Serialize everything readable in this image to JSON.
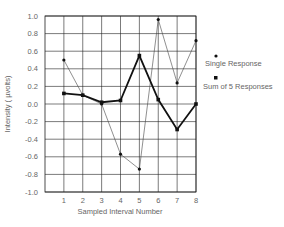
{
  "chart_data": {
    "type": "line",
    "title": "",
    "xlabel": "Sampled Interval Number",
    "ylabel": "Intensity ( µvolts)",
    "x": [
      1,
      2,
      3,
      4,
      5,
      6,
      7,
      8
    ],
    "xlim": [
      0,
      8
    ],
    "ylim": [
      -1.0,
      1.0
    ],
    "yticks": [
      "1.0",
      "0.8",
      "0.6",
      "0.4",
      "0.2",
      "0.0",
      "-0.2",
      "-0.4",
      "-0.6",
      "-0.8",
      "-1.0"
    ],
    "xticks": [
      "1",
      "2",
      "3",
      "4",
      "5",
      "6",
      "7",
      "8"
    ],
    "grid": true,
    "legend_position": "right",
    "series": [
      {
        "name": "Single Response",
        "marker": "circle",
        "line": "thin",
        "values": [
          0.5,
          0.1,
          0.0,
          -0.57,
          -0.74,
          0.96,
          0.24,
          0.72
        ]
      },
      {
        "name": "Sum of 5 Responses",
        "marker": "square",
        "line": "thick",
        "values": [
          0.12,
          0.1,
          0.02,
          0.04,
          0.55,
          0.05,
          -0.29,
          0.0
        ]
      }
    ]
  },
  "legend": {
    "single": "Single Response",
    "sum": "Sum of 5 Responses"
  },
  "axes": {
    "xlabel": "Sampled Interval Number",
    "ylabel": "Intensity ( µvolts)"
  }
}
